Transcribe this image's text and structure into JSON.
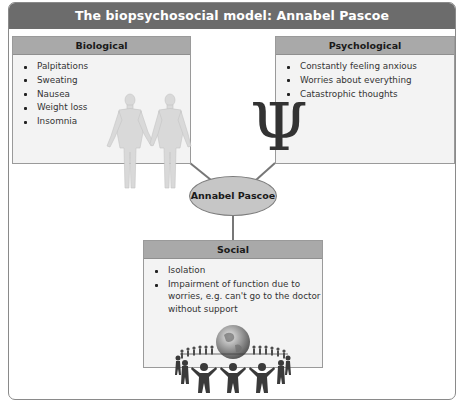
{
  "diagram": {
    "title": "The biopsychosocial model: Annabel Pascoe",
    "center_node": "Annabel Pascoe",
    "boxes": {
      "biological": {
        "heading": "Biological",
        "items": [
          "Palpitations",
          "Sweating",
          "Nausea",
          "Weight loss",
          "Insomnia"
        ],
        "illustration": "two-human-figures-holding-hands"
      },
      "psychological": {
        "heading": "Psychological",
        "items": [
          "Constantly feeling anxious",
          "Worries about everything",
          "Catastrophic thoughts"
        ],
        "illustration": "psi-symbol",
        "symbol": "Ψ"
      },
      "social": {
        "heading": "Social",
        "items": [
          "Isolation",
          "Impairment of function due to worries, e.g. can't go to the doctor without support"
        ],
        "illustration": "globe-with-ring-of-people"
      }
    },
    "connections": [
      {
        "from": "Biological",
        "to": "Annabel Pascoe"
      },
      {
        "from": "Psychological",
        "to": "Annabel Pascoe"
      },
      {
        "from": "Annabel Pascoe",
        "to": "Social"
      }
    ],
    "colors": {
      "title_bar": "#6c6c6c",
      "box_header": "#a9a9a9",
      "box_body": "#f3f3f3",
      "center_node": "#c6c6c6",
      "connector": "#777777"
    }
  }
}
